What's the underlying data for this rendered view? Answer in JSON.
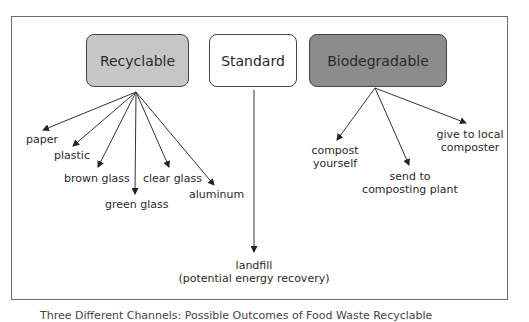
{
  "diagram": {
    "boxes": {
      "recyclable": {
        "label": "Recyclable",
        "fill": "#c6c6c6"
      },
      "standard": {
        "label": "Standard",
        "fill": "#ffffff"
      },
      "biodegradable": {
        "label": "Biodegradable",
        "fill": "#8c8c8c"
      }
    },
    "recyclable_outcomes": [
      "paper",
      "plastic",
      "brown glass",
      "green glass",
      "clear glass",
      "aluminum"
    ],
    "standard_outcome": {
      "line1": "landfill",
      "line2": "(potential energy recovery)"
    },
    "biodegradable_outcomes": [
      {
        "line1": "compost",
        "line2": "yourself"
      },
      {
        "line1": "send to",
        "line2": "composting plant"
      },
      {
        "line1": "give to local",
        "line2": "composter"
      }
    ],
    "caption": "Three Different Channels: Possible Outcomes of Food Waste Recyclable"
  }
}
